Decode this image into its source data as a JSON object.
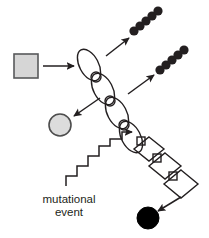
{
  "diagram": {
    "background_color": "#ffffff",
    "line_color": "#231f20",
    "labels": [
      {
        "id": "mutational",
        "text": "mutational",
        "x": 69,
        "y": 203
      },
      {
        "id": "event",
        "text": "event",
        "x": 69,
        "y": 216
      }
    ],
    "shapes": {
      "input_square": {
        "name": "gray-square",
        "label": "",
        "fill": "#d6d6d6",
        "stroke": "#58595b",
        "x": 14,
        "y": 54,
        "width": 24,
        "height": 24
      },
      "gray_circle": {
        "name": "gray-circle",
        "label": "",
        "fill": "#dcdcdc",
        "stroke": "#4d4d4d",
        "cx": 60,
        "cy": 125,
        "r": 11
      },
      "black_circle": {
        "name": "black-circle",
        "label": "",
        "fill": "#000000",
        "stroke": "#000000",
        "cx": 148,
        "cy": 218,
        "r": 11
      }
    },
    "ellipse_chain": {
      "name": "ellipse-chain",
      "count": 4,
      "fill": "none",
      "stroke": "#231f20",
      "ellipses": [
        {
          "cx": 89,
          "cy": 65,
          "rx": 9.5,
          "ry": 17,
          "rotate": -28
        },
        {
          "cx": 103,
          "cy": 89,
          "rx": 9.5,
          "ry": 17,
          "rotate": -28
        },
        {
          "cx": 117,
          "cy": 113,
          "rx": 9.5,
          "ry": 17,
          "rotate": -28
        },
        {
          "cx": 131,
          "cy": 137,
          "rx": 9.5,
          "ry": 17,
          "rotate": -28
        }
      ],
      "joint_circles": [
        {
          "cx": 96,
          "cy": 77,
          "r": 5
        },
        {
          "cx": 110,
          "cy": 101,
          "r": 5
        },
        {
          "cx": 124,
          "cy": 125,
          "r": 5
        }
      ]
    },
    "diamond_chain": {
      "name": "diamond-chain",
      "count": 3,
      "fill": "none",
      "stroke": "#231f20",
      "diamonds": [
        {
          "cx": 149,
          "cy": 149,
          "rx": 15,
          "ry": 12
        },
        {
          "cx": 164,
          "cy": 166,
          "rx": 16,
          "ry": 13
        },
        {
          "cx": 180,
          "cy": 184,
          "rx": 17,
          "ry": 14
        }
      ],
      "joint_squares": [
        {
          "cx": 141,
          "cy": 141,
          "size": 8
        },
        {
          "cx": 157,
          "cy": 158,
          "size": 8
        },
        {
          "cx": 173,
          "cy": 176,
          "size": 8
        }
      ]
    },
    "product_clusters": [
      {
        "name": "dark-circle-cluster-top",
        "label": "",
        "fill": "#231f20",
        "count": 5,
        "circles": [
          {
            "cx": 134,
            "cy": 31,
            "r": 4.6
          },
          {
            "cx": 140,
            "cy": 26,
            "r": 4.6
          },
          {
            "cx": 146,
            "cy": 21,
            "r": 4.6
          },
          {
            "cx": 152,
            "cy": 16,
            "r": 4.6
          },
          {
            "cx": 158,
            "cy": 11,
            "r": 4.6
          }
        ]
      },
      {
        "name": "dark-circle-cluster-middle",
        "label": "",
        "fill": "#231f20",
        "count": 5,
        "circles": [
          {
            "cx": 160,
            "cy": 70,
            "r": 4.6
          },
          {
            "cx": 166,
            "cy": 65,
            "r": 4.6
          },
          {
            "cx": 172,
            "cy": 60,
            "r": 4.6
          },
          {
            "cx": 178,
            "cy": 55,
            "r": 4.6
          },
          {
            "cx": 184,
            "cy": 50,
            "r": 4.6
          }
        ]
      }
    ],
    "arrows": [
      {
        "name": "arrow-square-to-chain",
        "x1": 43,
        "y1": 66,
        "x2": 76,
        "y2": 66,
        "head": "end"
      },
      {
        "name": "arrow-chain-to-cluster-top",
        "x1": 107,
        "y1": 55,
        "x2": 130,
        "y2": 37,
        "head": "end"
      },
      {
        "name": "arrow-chain-to-cluster-middle",
        "x1": 128,
        "y1": 94,
        "x2": 155,
        "y2": 74,
        "head": "end"
      },
      {
        "name": "arrow-chain-to-gray-circle",
        "x1": 100,
        "y1": 98,
        "x2": 72,
        "y2": 117,
        "head": "end"
      },
      {
        "name": "arrow-diamond-to-black-circle",
        "x1": 181,
        "y1": 196,
        "x2": 157,
        "y2": 212,
        "head": "end"
      }
    ],
    "zigzag_arrow": {
      "name": "zigzag-mutational-event-arrow",
      "steps": 7,
      "head": "end",
      "points": "66,186 66,176 77,176 77,166 88,166 88,156 99,156 99,146 110,146 110,139 122,139 122,132 133,132"
    }
  }
}
